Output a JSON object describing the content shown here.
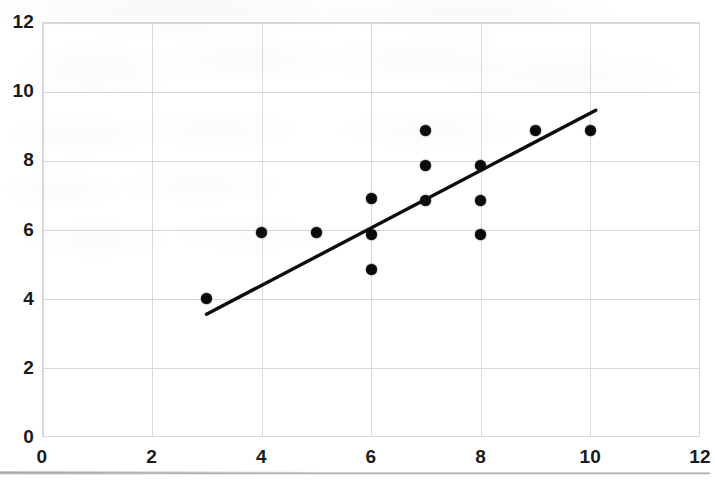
{
  "chart_data": {
    "type": "scatter",
    "title": "",
    "xlabel": "",
    "ylabel": "",
    "xlim": [
      0,
      12
    ],
    "ylim": [
      0,
      12
    ],
    "xticks": [
      0,
      2,
      4,
      6,
      8,
      10,
      12
    ],
    "yticks": [
      0,
      2,
      4,
      6,
      8,
      10,
      12
    ],
    "xtick_labels": [
      "0",
      "2",
      "4",
      "6",
      "8",
      "10",
      "12"
    ],
    "ytick_labels": [
      "0",
      "2",
      "4",
      "6",
      "8",
      "10",
      "12"
    ],
    "grid": true,
    "legend": false,
    "marker": {
      "shape": "circle",
      "color": "#0a0a0a",
      "size": 11
    },
    "points": [
      {
        "x": 3,
        "y": 4.0
      },
      {
        "x": 4,
        "y": 5.9
      },
      {
        "x": 5,
        "y": 5.9
      },
      {
        "x": 6,
        "y": 6.9
      },
      {
        "x": 6,
        "y": 5.85
      },
      {
        "x": 6,
        "y": 4.85
      },
      {
        "x": 7,
        "y": 8.85
      },
      {
        "x": 7,
        "y": 7.85
      },
      {
        "x": 7,
        "y": 6.85
      },
      {
        "x": 8,
        "y": 7.85
      },
      {
        "x": 8,
        "y": 6.85
      },
      {
        "x": 8,
        "y": 5.85
      },
      {
        "x": 9,
        "y": 8.85
      },
      {
        "x": 10,
        "y": 8.85
      }
    ],
    "trendline": {
      "type": "linear",
      "color": "#0d0d0d",
      "width": 3.4,
      "x_start": 3.0,
      "y_start": 3.55,
      "x_end": 10.1,
      "y_end": 9.45
    },
    "annotations": []
  }
}
